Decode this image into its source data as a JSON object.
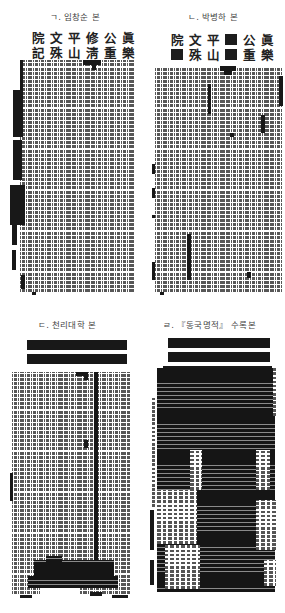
{
  "figure": {
    "panels": [
      {
        "id": "a",
        "caption": "ㄱ. 임창순 본",
        "title_chars": [
          "院",
          "文",
          "平",
          "修",
          "公",
          "眞",
          "記",
          "殊",
          "山",
          "淸",
          "重",
          "樂"
        ],
        "redacted_title_indices": []
      },
      {
        "id": "b",
        "caption": "ㄴ. 박병하 본",
        "title_chars": [
          "院",
          "文",
          "平",
          "",
          "公",
          "眞",
          "",
          "殊",
          "山",
          "",
          "重",
          "樂"
        ],
        "redacted_title_indices": [
          3,
          6,
          9
        ]
      },
      {
        "id": "c",
        "caption": "ㄷ. 천리대학 본",
        "title_chars": [],
        "title_redacted_bars": 2
      },
      {
        "id": "d",
        "caption": "ㄹ. 『동국명적』 수록본",
        "title_chars": [],
        "title_redacted_bars": 2
      }
    ]
  },
  "colors": {
    "ink": "#1d1d1d",
    "text_gray": "#3a3a3a",
    "paper": "#ffffff"
  }
}
